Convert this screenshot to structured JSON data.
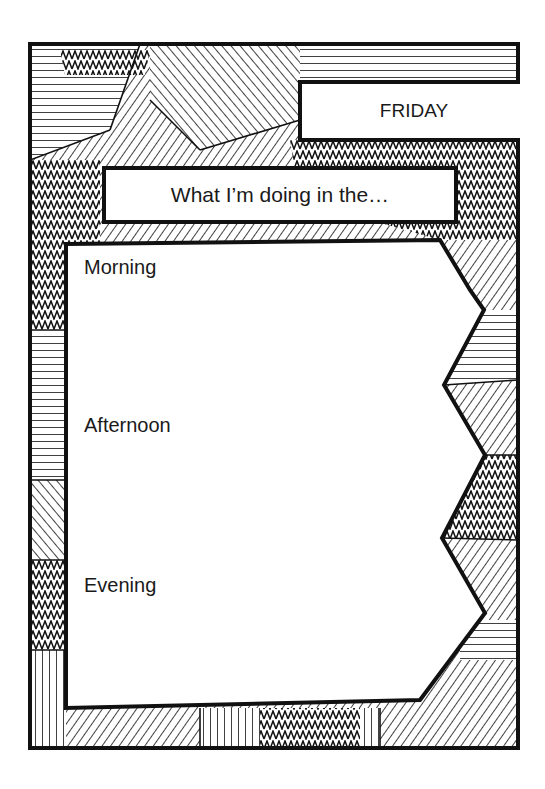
{
  "page": {
    "day": "FRIDAY",
    "heading": "What I’m doing in the…",
    "slots": [
      {
        "label": "Morning"
      },
      {
        "label": "Afternoon"
      },
      {
        "label": "Evening"
      }
    ]
  },
  "colors": {
    "ink": "#111111",
    "paper": "#ffffff"
  }
}
